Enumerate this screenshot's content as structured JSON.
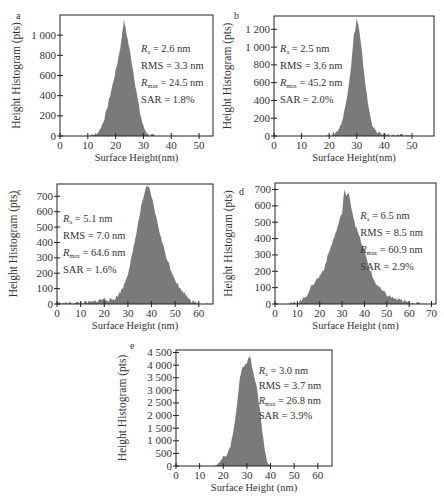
{
  "chart_data": [
    {
      "id": "a",
      "type": "area",
      "panel_label": "a",
      "xlabel": "Surface Height(nm)",
      "ylabel": "Height Histogram (pts)",
      "xlim": [
        0,
        55
      ],
      "ylim": [
        0,
        1200
      ],
      "xticks": [
        0,
        10,
        20,
        30,
        40,
        50
      ],
      "yticks": [
        0,
        200,
        400,
        600,
        800,
        1000
      ],
      "ytick_labels": [
        "0",
        "200",
        "400",
        "600",
        "800",
        "1 000"
      ],
      "annotations": {
        "Ra": "2.6 nm",
        "RMS": "3.3 nm",
        "Rmax": "24.5 nm",
        "SAR": "1.8%"
      },
      "annotation_pos": "right",
      "x": [
        9,
        11,
        13,
        14,
        15,
        16,
        17,
        18,
        19,
        20,
        21,
        22,
        22.5,
        23,
        23.5,
        24,
        25,
        26,
        27,
        28,
        29,
        30,
        31,
        32,
        34
      ],
      "values": [
        0,
        5,
        20,
        50,
        100,
        180,
        280,
        400,
        520,
        640,
        780,
        930,
        1060,
        1150,
        1080,
        1000,
        860,
        700,
        520,
        350,
        200,
        90,
        40,
        10,
        0
      ],
      "frame": {
        "left": 60,
        "top": 15,
        "right": 213,
        "bottom": 136
      }
    },
    {
      "id": "b",
      "type": "area",
      "panel_label": "b",
      "xlabel": "Surface Height(nm)",
      "ylabel": "Height Histogram (pts)",
      "xlim": [
        0,
        58
      ],
      "ylim": [
        0,
        1350
      ],
      "xticks": [
        0,
        10,
        20,
        30,
        40,
        50
      ],
      "yticks": [
        0,
        200,
        400,
        600,
        800,
        1000,
        1200
      ],
      "ytick_labels": [
        "0",
        "200",
        "400",
        "600",
        "800",
        "1 000",
        "1 200"
      ],
      "annotations": {
        "Ra": "2.5 nm",
        "RMS": "3.6 nm",
        "Rmax": "45.2 nm",
        "SAR": "2.0%"
      },
      "annotation_pos": "left",
      "x": [
        18,
        20,
        22,
        23,
        24,
        25,
        26,
        27,
        28,
        29,
        29.5,
        30,
        30.5,
        31,
        32,
        33,
        34,
        35,
        36,
        37,
        38,
        40,
        44,
        48,
        50
      ],
      "values": [
        0,
        5,
        30,
        60,
        110,
        200,
        360,
        560,
        800,
        1150,
        1200,
        1330,
        1250,
        1160,
        900,
        620,
        380,
        200,
        100,
        50,
        30,
        15,
        8,
        3,
        0
      ],
      "frame": {
        "left": 274,
        "top": 16,
        "right": 434,
        "bottom": 136
      }
    },
    {
      "id": "c",
      "type": "area",
      "panel_label": "c",
      "xlabel": "Surface Height (nm)",
      "ylabel": "Height Histogram (pts)",
      "xlim": [
        0,
        66
      ],
      "ylim": [
        0,
        780
      ],
      "xticks": [
        0,
        10,
        20,
        30,
        40,
        50,
        60
      ],
      "yticks": [
        0,
        100,
        200,
        300,
        400,
        500,
        600,
        700
      ],
      "ytick_labels": [
        "0",
        "100",
        "200",
        "300",
        "400",
        "500",
        "600",
        "700"
      ],
      "annotations": {
        "Ra": "5.1 nm",
        "RMS": "7.0 nm",
        "Rmax": "64.6 nm",
        "SAR": "1.6%"
      },
      "annotation_pos": "left",
      "x": [
        0,
        5,
        10,
        15,
        18,
        20,
        22,
        24,
        26,
        28,
        30,
        32,
        34,
        36,
        37,
        38,
        39,
        40,
        42,
        44,
        46,
        48,
        50,
        52,
        54,
        56,
        57,
        60,
        64
      ],
      "values": [
        5,
        5,
        8,
        12,
        25,
        35,
        25,
        30,
        60,
        110,
        200,
        330,
        500,
        660,
        720,
        760,
        750,
        700,
        560,
        430,
        320,
        230,
        160,
        100,
        70,
        40,
        15,
        5,
        0
      ],
      "frame": {
        "left": 57,
        "top": 184,
        "right": 213,
        "bottom": 304
      }
    },
    {
      "id": "d",
      "type": "area",
      "panel_label": "d",
      "xlabel": "Surface Height (nm)",
      "ylabel": "Height Histogram (pts)",
      "xlim": [
        0,
        72
      ],
      "ylim": [
        0,
        740
      ],
      "xticks": [
        0,
        10,
        20,
        30,
        40,
        50,
        60,
        70
      ],
      "yticks": [
        0,
        100,
        200,
        300,
        400,
        500,
        600,
        700
      ],
      "ytick_labels": [
        "0",
        "100",
        "200",
        "300",
        "400",
        "500",
        "600",
        "700"
      ],
      "annotations": {
        "Ra": "6.5 nm",
        "RMS": "8.5 nm",
        "Rmax": "60.9 nm",
        "SAR": "2.9%"
      },
      "annotation_pos": "right",
      "x": [
        5,
        8,
        10,
        12,
        14,
        16,
        18,
        20,
        22,
        24,
        26,
        28,
        30,
        31,
        32,
        33,
        34,
        36,
        38,
        40,
        42,
        44,
        46,
        48,
        50,
        54,
        58,
        62,
        66
      ],
      "values": [
        0,
        3,
        10,
        25,
        50,
        100,
        140,
        170,
        220,
        310,
        390,
        470,
        560,
        700,
        650,
        690,
        600,
        480,
        400,
        320,
        230,
        150,
        110,
        80,
        55,
        30,
        15,
        5,
        0
      ],
      "frame": {
        "left": 275,
        "top": 183,
        "right": 436,
        "bottom": 304
      }
    },
    {
      "id": "e",
      "type": "area",
      "panel_label": "e",
      "xlabel": "Surface Height (nm)",
      "ylabel": "Height Histogram (pts)",
      "xlim": [
        0,
        66
      ],
      "ylim": [
        0,
        4600
      ],
      "xticks": [
        0,
        10,
        20,
        30,
        40,
        50,
        60
      ],
      "yticks": [
        0,
        500,
        1000,
        1500,
        2000,
        2500,
        3000,
        3500,
        4000,
        4500
      ],
      "ytick_labels": [
        "0",
        "500",
        "1 000",
        "1 500",
        "2 000",
        "2 500",
        "3 000",
        "3 500",
        "4 000",
        "4 500"
      ],
      "annotations": {
        "Ra": "3.0 nm",
        "RMS": "3.7 nm",
        "Rmax": "26.8 nm",
        "SAR": "3.9%"
      },
      "annotation_pos": "right",
      "x": [
        16,
        18,
        19,
        20,
        21,
        22,
        23,
        24,
        25,
        26,
        27,
        28,
        29,
        30,
        31,
        31.5,
        32,
        33,
        34,
        35,
        36,
        37,
        38,
        39,
        40
      ],
      "values": [
        0,
        80,
        200,
        400,
        350,
        500,
        800,
        1200,
        1800,
        2600,
        3500,
        3900,
        4000,
        4100,
        4350,
        4300,
        4000,
        3600,
        3200,
        2600,
        1800,
        1000,
        400,
        100,
        0
      ],
      "frame": {
        "left": 176,
        "top": 350,
        "right": 332,
        "bottom": 466
      }
    }
  ],
  "colors": {
    "fill": "#7a7a7a",
    "axis": "#222222"
  }
}
